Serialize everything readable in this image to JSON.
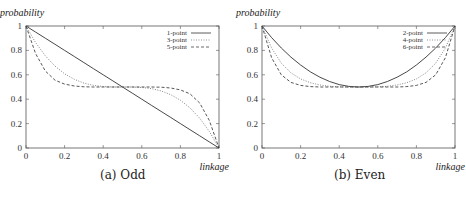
{
  "chart_data": [
    {
      "type": "line",
      "title": "",
      "caption": "(a) Odd",
      "xlabel": "linkage",
      "ylabel": "probability",
      "xlim": [
        0,
        1
      ],
      "ylim": [
        0,
        1
      ],
      "xticks": [
        "0",
        "0.2",
        "0.4",
        "0.6",
        "0.8",
        "1"
      ],
      "yticks": [
        "0",
        "0.2",
        "0.4",
        "0.6",
        "0.8",
        "1"
      ],
      "legend_position": "upper right",
      "x": [
        0,
        0.05,
        0.1,
        0.15,
        0.2,
        0.25,
        0.3,
        0.35,
        0.4,
        0.45,
        0.5,
        0.55,
        0.6,
        0.65,
        0.7,
        0.75,
        0.8,
        0.85,
        0.9,
        0.95,
        1
      ],
      "series": [
        {
          "name": "1-point",
          "style": "solid",
          "values": [
            1,
            0.95,
            0.9,
            0.85,
            0.8,
            0.75,
            0.7,
            0.65,
            0.6,
            0.55,
            0.5,
            0.45,
            0.4,
            0.35,
            0.3,
            0.25,
            0.2,
            0.15,
            0.1,
            0.05,
            0
          ]
        },
        {
          "name": "3-point",
          "style": "dotted",
          "values": [
            1,
            0.864,
            0.756,
            0.671,
            0.608,
            0.563,
            0.532,
            0.513,
            0.504,
            0.5,
            0.5,
            0.5,
            0.496,
            0.487,
            0.468,
            0.437,
            0.392,
            0.329,
            0.244,
            0.136,
            0
          ]
        },
        {
          "name": "5-point",
          "style": "dashed",
          "values": [
            1,
            0.774,
            0.631,
            0.556,
            0.524,
            0.508,
            0.502,
            0.5,
            0.5,
            0.5,
            0.5,
            0.5,
            0.5,
            0.5,
            0.498,
            0.492,
            0.476,
            0.444,
            0.369,
            0.226,
            0
          ]
        }
      ]
    },
    {
      "type": "line",
      "title": "",
      "caption": "(b) Even",
      "xlabel": "linkage",
      "ylabel": "probability",
      "xlim": [
        0,
        1
      ],
      "ylim": [
        0,
        1
      ],
      "xticks": [
        "0",
        "0.2",
        "0.4",
        "0.6",
        "0.8",
        "1"
      ],
      "yticks": [
        "0",
        "0.2",
        "0.4",
        "0.6",
        "0.8",
        "1"
      ],
      "legend_position": "upper right",
      "x": [
        0,
        0.05,
        0.1,
        0.15,
        0.2,
        0.25,
        0.3,
        0.35,
        0.4,
        0.45,
        0.5,
        0.55,
        0.6,
        0.65,
        0.7,
        0.75,
        0.8,
        0.85,
        0.9,
        0.95,
        1
      ],
      "series": [
        {
          "name": "2-point",
          "style": "solid",
          "values": [
            1,
            0.905,
            0.82,
            0.745,
            0.68,
            0.625,
            0.58,
            0.545,
            0.52,
            0.505,
            0.5,
            0.505,
            0.52,
            0.545,
            0.58,
            0.625,
            0.68,
            0.745,
            0.82,
            0.905,
            1
          ]
        },
        {
          "name": "4-point",
          "style": "dotted",
          "values": [
            1,
            0.82,
            0.695,
            0.616,
            0.566,
            0.535,
            0.516,
            0.506,
            0.502,
            0.5,
            0.5,
            0.5,
            0.502,
            0.506,
            0.516,
            0.535,
            0.566,
            0.616,
            0.695,
            0.82,
            1
          ]
        },
        {
          "name": "6-point",
          "style": "dashed",
          "values": [
            1,
            0.74,
            0.6,
            0.538,
            0.513,
            0.503,
            0.5,
            0.5,
            0.5,
            0.5,
            0.5,
            0.5,
            0.5,
            0.5,
            0.5,
            0.503,
            0.513,
            0.538,
            0.6,
            0.74,
            1
          ]
        }
      ]
    }
  ]
}
